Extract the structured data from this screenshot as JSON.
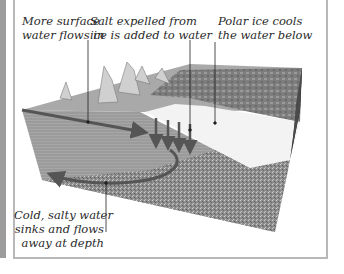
{
  "diagram": {
    "labels": {
      "surface_inflow": [
        "More surface",
        "water flows in"
      ],
      "salt_expelled": [
        "Salt expelled from",
        "ice is added to water"
      ],
      "ice_cools": [
        "Polar ice cools",
        "the water below"
      ],
      "deep_outflow": [
        "Cold, salty water",
        "sinks and flows",
        "away at depth"
      ]
    },
    "arrows": [
      {
        "id": "surface-inflow-arrow",
        "direction": "right",
        "meaning": "surface water flows in"
      },
      {
        "id": "sinking-arrows",
        "count": 4,
        "direction": "down",
        "meaning": "salt added / water sinks"
      },
      {
        "id": "deep-outflow-arrow",
        "direction": "left, curved",
        "meaning": "cold salty water flows away at depth"
      }
    ],
    "colors": {
      "water_face": "#9a9a9a",
      "ice": "#f4f4f4",
      "seabed": "#8c8c8c",
      "side_face": "#1e1e1e",
      "arrow": "#555555",
      "frame": "#b8b8b8",
      "strip": "#9c9c9c"
    }
  }
}
